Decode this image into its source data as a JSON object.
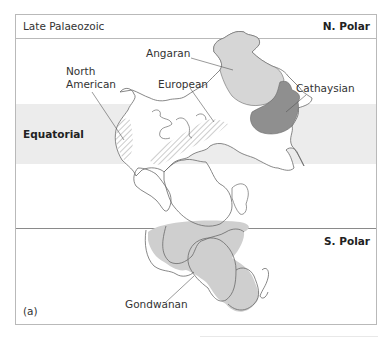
{
  "figure": {
    "title": "Late Palaeozoic",
    "panel_label": "(a)",
    "zones": {
      "north": "N. Polar",
      "equator": "Equatorial",
      "south": "S. Polar"
    },
    "regions": {
      "angaran": "Angaran",
      "north_american_line1": "North",
      "north_american_line2": "American",
      "european": "European",
      "cathaysian": "Cathaysian",
      "gondwanan": "Gondwanan"
    },
    "colors": {
      "frame": "#b9b9b9",
      "equatorial_band": "#ececec",
      "angaran_fill": "#d6d6d6",
      "cathaysian_fill": "#8f8f8f",
      "gondwanan_fill": "#cfcfcf",
      "hatch": "#9a9a9a",
      "outline": "#666666"
    }
  }
}
